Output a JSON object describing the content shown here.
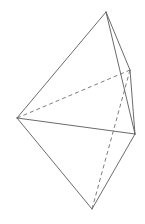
{
  "figure": {
    "title": "Bipyramid wireframe line drawing",
    "kind": "geometric-solid-diagram",
    "background_color": "#ffffff",
    "canvas": {
      "width": 145,
      "height": 224
    },
    "style": {
      "solid_edge_color": "#5a5a5a",
      "dashed_edge_color": "#6e6e6e",
      "solid_edge_width": 0.9,
      "dashed_edge_width": 0.9,
      "dash_pattern": "4,3",
      "face_fill": "none"
    },
    "vertices": [
      {
        "id": "apex",
        "label": "top apex",
        "x": 106,
        "y": 12
      },
      {
        "id": "left",
        "label": "left vertex",
        "x": 17,
        "y": 118
      },
      {
        "id": "back",
        "label": "back right vertex",
        "x": 130,
        "y": 70
      },
      {
        "id": "right",
        "label": "right vertex",
        "x": 135,
        "y": 134
      },
      {
        "id": "bottom",
        "label": "bottom apex",
        "x": 92,
        "y": 209
      }
    ],
    "edges": [
      {
        "id": "apex-left",
        "from": "apex",
        "to": "left",
        "style": "solid"
      },
      {
        "id": "apex-back",
        "from": "apex",
        "to": "back",
        "style": "solid"
      },
      {
        "id": "apex-right",
        "from": "apex",
        "to": "right",
        "style": "solid"
      },
      {
        "id": "left-right",
        "from": "left",
        "to": "right",
        "style": "solid"
      },
      {
        "id": "left-bottom",
        "from": "left",
        "to": "bottom",
        "style": "solid"
      },
      {
        "id": "right-bottom",
        "from": "right",
        "to": "bottom",
        "style": "solid"
      },
      {
        "id": "back-right",
        "from": "back",
        "to": "right",
        "style": "solid"
      },
      {
        "id": "left-back",
        "from": "left",
        "to": "back",
        "style": "dashed"
      },
      {
        "id": "back-bottom",
        "from": "back",
        "to": "bottom",
        "style": "dashed"
      }
    ]
  }
}
